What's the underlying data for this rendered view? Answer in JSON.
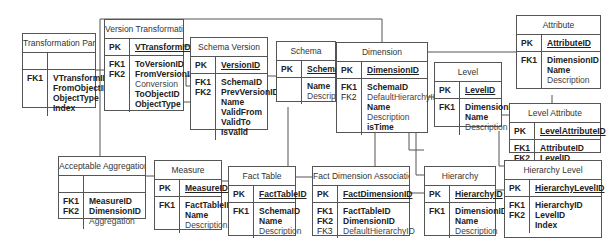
{
  "diagram": {
    "type": "er-diagram",
    "entities": [
      {
        "id": "transformation-part",
        "name": "Transformation Part",
        "pk": {
          "keys": [],
          "fields": []
        },
        "attrs": {
          "keys": [
            "FK1"
          ],
          "fields": [
            {
              "t": "VTransformID",
              "b": true
            },
            {
              "t": "FromObjectID",
              "b": true
            },
            {
              "t": "ObjectType",
              "b": true
            },
            {
              "t": "Index",
              "b": true
            }
          ]
        }
      },
      {
        "id": "version-transformation",
        "name": "Version Transformation",
        "pk": {
          "keys": [
            "PK"
          ],
          "fields": [
            {
              "t": "VTransformID",
              "b": true
            }
          ]
        },
        "attrs": {
          "keys": [
            "FK1",
            "FK2"
          ],
          "fields": [
            {
              "t": "ToVersionID",
              "b": true
            },
            {
              "t": "FromVersionID",
              "b": true
            },
            {
              "t": "Conversion",
              "b": false
            },
            {
              "t": "ToObjectID",
              "b": true
            },
            {
              "t": "ObjectType",
              "b": true
            }
          ]
        }
      },
      {
        "id": "schema-version",
        "name": "Schema Version",
        "pk": {
          "keys": [
            "PK"
          ],
          "fields": [
            {
              "t": "VersionID",
              "b": true
            }
          ]
        },
        "attrs": {
          "keys": [
            "FK1",
            "FK2"
          ],
          "fields": [
            {
              "t": "SchemaID",
              "b": true
            },
            {
              "t": "PrevVersionID",
              "b": true
            },
            {
              "t": "Name",
              "b": true
            },
            {
              "t": "ValidFrom",
              "b": true
            },
            {
              "t": "ValidTo",
              "b": true
            },
            {
              "t": "IsValid",
              "b": true
            }
          ]
        }
      },
      {
        "id": "schema",
        "name": "Schema",
        "pk": {
          "keys": [
            "PK"
          ],
          "fields": [
            {
              "t": "SchemaID",
              "b": true
            }
          ]
        },
        "attrs": {
          "keys": [],
          "fields": [
            {
              "t": "Name",
              "b": true
            },
            {
              "t": "Description",
              "b": false
            }
          ]
        }
      },
      {
        "id": "dimension",
        "name": "Dimension",
        "pk": {
          "keys": [
            "PK"
          ],
          "fields": [
            {
              "t": "DimensionID",
              "b": true
            }
          ]
        },
        "attrs": {
          "keys": [
            "FK1",
            "FK2"
          ],
          "fields": [
            {
              "t": "SchemaID",
              "b": true
            },
            {
              "t": "DefaultHierarchyID",
              "b": false
            },
            {
              "t": "Name",
              "b": true
            },
            {
              "t": "Description",
              "b": false
            },
            {
              "t": "isTime",
              "b": true
            }
          ]
        }
      },
      {
        "id": "level",
        "name": "Level",
        "pk": {
          "keys": [
            "PK"
          ],
          "fields": [
            {
              "t": "LevelID",
              "b": true
            }
          ]
        },
        "attrs": {
          "keys": [
            "FK1"
          ],
          "fields": [
            {
              "t": "DimensionID",
              "b": true
            },
            {
              "t": "Name",
              "b": true
            },
            {
              "t": "Description",
              "b": false
            }
          ]
        }
      },
      {
        "id": "attribute",
        "name": "Attribute",
        "pk": {
          "keys": [
            "PK"
          ],
          "fields": [
            {
              "t": "AttributeID",
              "b": true
            }
          ]
        },
        "attrs": {
          "keys": [
            "FK1"
          ],
          "fields": [
            {
              "t": "DimensionID",
              "b": true
            },
            {
              "t": "Name",
              "b": true
            },
            {
              "t": "Description",
              "b": false
            }
          ]
        }
      },
      {
        "id": "level-attribute",
        "name": "Level Attribute",
        "pk": {
          "keys": [
            "PK"
          ],
          "fields": [
            {
              "t": "LevelAttributeID",
              "b": true
            }
          ]
        },
        "attrs": {
          "keys": [
            "FK1",
            "FK2"
          ],
          "fields": [
            {
              "t": "AttributeID",
              "b": true
            },
            {
              "t": "LevelID",
              "b": true
            }
          ]
        }
      },
      {
        "id": "acceptable-aggregation",
        "name": "Acceptable Aggregation",
        "pk": {
          "keys": [],
          "fields": []
        },
        "attrs": {
          "keys": [
            "FK1",
            "FK2"
          ],
          "fields": [
            {
              "t": "MeasureID",
              "b": true
            },
            {
              "t": "DimensionID",
              "b": true
            },
            {
              "t": "Aggregation",
              "b": false
            }
          ]
        }
      },
      {
        "id": "measure",
        "name": "Measure",
        "pk": {
          "keys": [
            "PK"
          ],
          "fields": [
            {
              "t": "MeasureID",
              "b": true
            }
          ]
        },
        "attrs": {
          "keys": [
            "FK1"
          ],
          "fields": [
            {
              "t": "FactTableID",
              "b": true
            },
            {
              "t": "Name",
              "b": true
            },
            {
              "t": "Description",
              "b": false
            }
          ]
        }
      },
      {
        "id": "fact-table",
        "name": "Fact Table",
        "pk": {
          "keys": [
            "PK"
          ],
          "fields": [
            {
              "t": "FactTableID",
              "b": true
            }
          ]
        },
        "attrs": {
          "keys": [
            "FK1"
          ],
          "fields": [
            {
              "t": "SchemaID",
              "b": true
            },
            {
              "t": "Name",
              "b": true
            },
            {
              "t": "Description",
              "b": false
            }
          ]
        }
      },
      {
        "id": "fact-dimension-association",
        "name": "Fact Dimension Association",
        "pk": {
          "keys": [
            "PK"
          ],
          "fields": [
            {
              "t": "FactDimensionID",
              "b": true
            }
          ]
        },
        "attrs": {
          "keys": [
            "FK1",
            "FK2",
            "FK3"
          ],
          "fields": [
            {
              "t": "FactTableID",
              "b": true
            },
            {
              "t": "DimensionID",
              "b": true
            },
            {
              "t": "DefaultHierarchyID",
              "b": false
            }
          ]
        }
      },
      {
        "id": "hierarchy",
        "name": "Hierarchy",
        "pk": {
          "keys": [
            "PK"
          ],
          "fields": [
            {
              "t": "HierarchyID",
              "b": true
            }
          ]
        },
        "attrs": {
          "keys": [
            "FK1"
          ],
          "fields": [
            {
              "t": "DimensionID",
              "b": true
            },
            {
              "t": "Name",
              "b": true
            },
            {
              "t": "Description",
              "b": false
            }
          ]
        }
      },
      {
        "id": "hierarchy-level",
        "name": "Hierarchy Level",
        "pk": {
          "keys": [
            "PK"
          ],
          "fields": [
            {
              "t": "HierarchyLevelID",
              "b": true
            }
          ]
        },
        "attrs": {
          "keys": [
            "FK1",
            "FK2"
          ],
          "fields": [
            {
              "t": "HierarchyID",
              "b": true
            },
            {
              "t": "LevelID",
              "b": true
            },
            {
              "t": "Index",
              "b": true
            }
          ]
        }
      }
    ],
    "relationships": [
      {
        "from": "transformation-part",
        "to": "version-transformation"
      },
      {
        "from": "version-transformation",
        "to": "schema-version"
      },
      {
        "from": "schema-version",
        "to": "schema-version"
      },
      {
        "from": "schema-version",
        "to": "schema"
      },
      {
        "from": "dimension",
        "to": "schema"
      },
      {
        "from": "attribute",
        "to": "dimension"
      },
      {
        "from": "level",
        "to": "dimension"
      },
      {
        "from": "level-attribute",
        "to": "attribute"
      },
      {
        "from": "level-attribute",
        "to": "level"
      },
      {
        "from": "acceptable-aggregation",
        "to": "measure"
      },
      {
        "from": "acceptable-aggregation",
        "to": "dimension"
      },
      {
        "from": "measure",
        "to": "fact-table"
      },
      {
        "from": "fact-table",
        "to": "schema"
      },
      {
        "from": "fact-dimension-association",
        "to": "fact-table"
      },
      {
        "from": "fact-dimension-association",
        "to": "dimension"
      },
      {
        "from": "fact-dimension-association",
        "to": "hierarchy"
      },
      {
        "from": "hierarchy",
        "to": "dimension"
      },
      {
        "from": "hierarchy-level",
        "to": "hierarchy"
      },
      {
        "from": "hierarchy-level",
        "to": "level"
      }
    ]
  },
  "colors": {
    "line": "#555555",
    "text": "#222222",
    "muted": "#444444",
    "background": "#ffffff"
  }
}
